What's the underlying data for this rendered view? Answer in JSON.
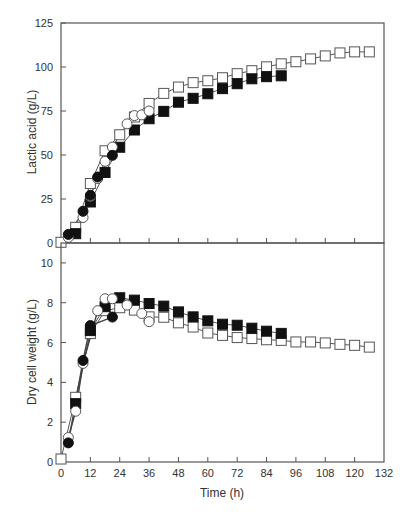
{
  "chart_data": [
    {
      "type": "line",
      "panel": "top",
      "title": "",
      "xlabel": "",
      "ylabel": "Lactic acid (g/L)",
      "xlim": [
        0,
        132
      ],
      "ylim": [
        0,
        125
      ],
      "yticks": [
        0,
        25,
        50,
        75,
        100,
        125
      ],
      "xticks": [
        0,
        12,
        24,
        36,
        48,
        60,
        72,
        84,
        96,
        108,
        120,
        132
      ],
      "grid": false,
      "legend": null,
      "series": [
        {
          "name": "open squares",
          "marker": "square-open",
          "x": [
            0,
            6,
            12,
            18,
            24,
            30,
            36,
            42,
            48,
            54,
            60,
            66,
            72,
            78,
            84,
            90,
            96,
            102,
            108,
            114,
            120,
            126
          ],
          "values": [
            0.4,
            8.9,
            33.8,
            52.4,
            61.5,
            71.6,
            79.3,
            85.0,
            88.6,
            91.1,
            92.2,
            93.9,
            96.2,
            97.9,
            100.1,
            101.8,
            103.0,
            104.6,
            106.3,
            108.0,
            108.6,
            108.6
          ]
        },
        {
          "name": "filled squares",
          "marker": "square-filled",
          "x": [
            6,
            12,
            18,
            24,
            30,
            36,
            42,
            48,
            54,
            60,
            66,
            72,
            78,
            84,
            90
          ],
          "values": [
            5.3,
            23.3,
            40.1,
            54.4,
            64.2,
            70.6,
            74.8,
            80.0,
            82.2,
            84.8,
            87.7,
            90.5,
            93.3,
            94.5,
            95.0
          ]
        },
        {
          "name": "open circles",
          "marker": "circle-open",
          "x": [
            3,
            9,
            12,
            15,
            18,
            21,
            27,
            30,
            33,
            36
          ],
          "values": [
            3.2,
            14.5,
            26.5,
            36.6,
            46.4,
            54.5,
            67.7,
            72.4,
            72.8,
            75.0
          ]
        },
        {
          "name": "filled circles",
          "marker": "circle-filled",
          "x": [
            3,
            9,
            12,
            15,
            21
          ],
          "values": [
            4.9,
            18.0,
            27.1,
            37.5,
            49.8
          ]
        }
      ]
    },
    {
      "type": "line",
      "panel": "bottom",
      "title": "",
      "xlabel": "Time (h)",
      "ylabel": "Dry cell weight (g/L)",
      "xlim": [
        0,
        132
      ],
      "ylim": [
        0,
        11
      ],
      "yticks": [
        0,
        2,
        4,
        6,
        8,
        10
      ],
      "xticks": [
        0,
        12,
        24,
        36,
        48,
        60,
        72,
        84,
        96,
        108,
        120,
        132
      ],
      "grid": false,
      "legend": null,
      "series": [
        {
          "name": "open squares",
          "marker": "square-open",
          "x": [
            0,
            6,
            12,
            18,
            24,
            30,
            36,
            42,
            48,
            54,
            60,
            66,
            72,
            78,
            84,
            90,
            96,
            102,
            108,
            114,
            120,
            126
          ],
          "values": [
            0.15,
            3.25,
            6.45,
            7.6,
            7.75,
            7.63,
            7.29,
            7.27,
            6.99,
            6.78,
            6.48,
            6.36,
            6.25,
            6.2,
            6.14,
            6.11,
            6.03,
            6.03,
            5.98,
            5.91,
            5.86,
            5.77
          ]
        },
        {
          "name": "filled squares",
          "marker": "square-filled",
          "x": [
            6,
            12,
            18,
            24,
            30,
            36,
            42,
            48,
            54,
            60,
            66,
            72,
            78,
            84,
            90
          ],
          "values": [
            2.93,
            6.6,
            7.8,
            8.25,
            8.13,
            7.96,
            7.83,
            7.54,
            7.29,
            7.09,
            6.92,
            6.87,
            6.72,
            6.57,
            6.46
          ]
        },
        {
          "name": "open circles",
          "marker": "circle-open",
          "x": [
            3,
            6,
            9,
            15,
            18,
            21,
            27,
            33,
            36
          ],
          "values": [
            1.23,
            2.55,
            4.95,
            7.6,
            8.2,
            8.2,
            7.88,
            7.46,
            7.05
          ]
        },
        {
          "name": "filled circles",
          "marker": "circle-filled",
          "x": [
            3,
            9,
            12,
            21
          ],
          "values": [
            0.96,
            5.1,
            6.85,
            7.28
          ]
        }
      ]
    }
  ],
  "labels": {
    "top_ylabel": "Lactic acid (g/L)",
    "bottom_ylabel": "Dry cell weight (g/L)",
    "xlabel": "Time (h)"
  }
}
